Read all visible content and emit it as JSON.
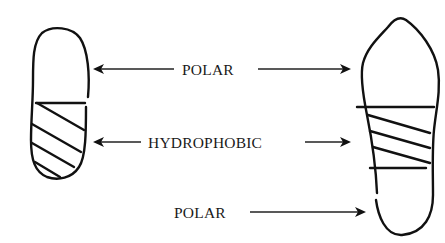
{
  "diagram": {
    "type": "molecule-regions",
    "labels": {
      "top": "POLAR",
      "middle": "HYDROPHOBIC",
      "bottom": "POLAR"
    },
    "shapes": [
      {
        "name": "small-molecule",
        "regions": [
          "polar",
          "hydrophobic"
        ]
      },
      {
        "name": "large-molecule",
        "regions": [
          "polar",
          "hydrophobic",
          "polar"
        ]
      }
    ],
    "colors": {
      "ink": "#111111",
      "background": "#ffffff"
    }
  }
}
